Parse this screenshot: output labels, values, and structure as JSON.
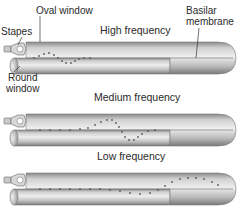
{
  "labels": {
    "stapes": "Stapes",
    "oval_window": "Oval window",
    "basilar_line1": "Basilar",
    "basilar_line2": "membrane",
    "round_line1": "Round",
    "round_line2": "window"
  },
  "panels": [
    {
      "title": "High frequency",
      "wave_region": "base (near stapes)"
    },
    {
      "title": "Medium frequency",
      "wave_region": "middle"
    },
    {
      "title": "Low frequency",
      "wave_region": "apex (far end)"
    }
  ],
  "colors": {
    "tube_light": "#e6e6e6",
    "tube_mid": "#b8b8b8",
    "tube_dark": "#7a7a7a",
    "dots": "#5a5a5a",
    "text": "#2a2a2a"
  }
}
